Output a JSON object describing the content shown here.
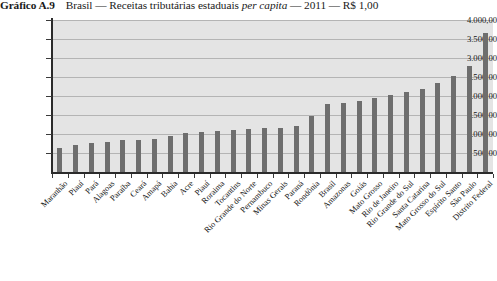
{
  "figure": {
    "label": "Gráfico A.9",
    "title_before_italic": "Brasil — Receitas tributárias estaduais ",
    "title_italic": "per capita",
    "title_after_italic": " — 2011 — R$ 1,00"
  },
  "chart_data": {
    "type": "bar",
    "xlabel": "",
    "ylabel": "",
    "ylim": [
      0,
      4000
    ],
    "grid": true,
    "legend": false,
    "ytick_labels": [
      "4.000,00",
      "3.500,00",
      "3.000,00",
      "2.500,00",
      "2.000,00",
      "1.500,00",
      "1.000,00",
      "500,00"
    ],
    "ytick_values": [
      4000,
      3500,
      3000,
      2500,
      2000,
      1500,
      1000,
      500
    ],
    "categories": [
      "Maranhão",
      "Piauí",
      "Pará",
      "Alagoas",
      "Paraíba",
      "Ceará",
      "Amapá",
      "Bahia",
      "Acre",
      "Piauí",
      "Roraima",
      "Tocantins",
      "Rio Grande do Norte",
      "Pernambuco",
      "Minas Gerais",
      "Paraná",
      "Rondônia",
      "Brasil",
      "Amazonas",
      "Goiás",
      "Mato Grosso",
      "Rio de Janeiro",
      "Rio Grande do Sul",
      "Santa Catarina",
      "Mato Grosso do Sul",
      "Espírito Santo",
      "São Paulo",
      "Distrito Federal"
    ],
    "values": [
      620,
      700,
      760,
      800,
      830,
      850,
      880,
      960,
      1020,
      1060,
      1090,
      1110,
      1130,
      1150,
      1170,
      1200,
      1480,
      1800,
      1820,
      1870,
      1960,
      2020,
      2100,
      2180,
      2350,
      2520,
      2800,
      3650
    ],
    "colors": {
      "bar": "#6e6e6e",
      "plot_background": "#e4e4e4",
      "gridline": "#b4b4b4",
      "axis": "#2b2b2b",
      "page_background": "#ffffff",
      "text": "#141414"
    }
  }
}
